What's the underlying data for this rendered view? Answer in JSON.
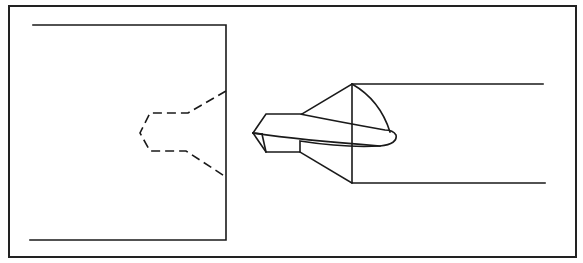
{
  "figure": {
    "elements": [
      {
        "name": "outer-frame",
        "type": "rectangle"
      },
      {
        "name": "workpiece",
        "type": "block",
        "side": "left"
      },
      {
        "name": "countersink-hole-profile",
        "type": "dashed-outline"
      },
      {
        "name": "countersink-tool",
        "type": "cutter",
        "side": "right"
      }
    ],
    "colors": {
      "line": "#1a1a1a",
      "background": "#ffffff"
    }
  }
}
